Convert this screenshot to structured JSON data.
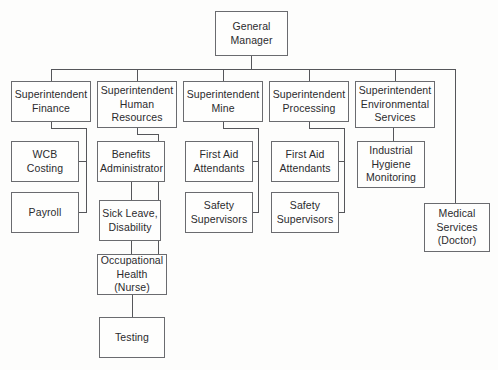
{
  "chart_data": {
    "type": "diagram",
    "diagram_type": "organizational-chart",
    "title": "",
    "orientation": "top-down",
    "line_color": "#55565a",
    "box_border_color": "#6a6b6f",
    "background_color": "#fdfdfc",
    "text_color": "#2b2b2d",
    "nodes": [
      {
        "id": "gm",
        "label": "General\nManager",
        "level": 0,
        "x": 215,
        "y": 11,
        "w": 73,
        "h": 45
      },
      {
        "id": "sup_finance",
        "label": "Superintendent\nFinance",
        "level": 1,
        "parent": "gm",
        "x": 11,
        "y": 81,
        "w": 80,
        "h": 41
      },
      {
        "id": "sup_hr",
        "label": "Superintendent\nHuman\nResources",
        "level": 1,
        "parent": "gm",
        "x": 97,
        "y": 81,
        "w": 80,
        "h": 47
      },
      {
        "id": "sup_mine",
        "label": "Superintendent\nMine",
        "level": 1,
        "parent": "gm",
        "x": 183,
        "y": 81,
        "w": 80,
        "h": 41
      },
      {
        "id": "sup_processing",
        "label": "Superintendent\nProcessing",
        "level": 1,
        "parent": "gm",
        "x": 269,
        "y": 81,
        "w": 80,
        "h": 41
      },
      {
        "id": "sup_env",
        "label": "Superintendent\nEnvironmental\nServices",
        "level": 1,
        "parent": "gm",
        "x": 355,
        "y": 81,
        "w": 80,
        "h": 47
      },
      {
        "id": "wcb",
        "label": "WCB\nCosting",
        "level": 2,
        "parent": "sup_finance",
        "x": 11,
        "y": 141,
        "w": 68,
        "h": 41
      },
      {
        "id": "payroll",
        "label": "Payroll",
        "level": 2,
        "parent": "sup_finance",
        "x": 11,
        "y": 192,
        "w": 68,
        "h": 41
      },
      {
        "id": "benefits",
        "label": "Benefits\nAdministrator",
        "level": 2,
        "parent": "sup_hr",
        "x": 97,
        "y": 141,
        "w": 68,
        "h": 41
      },
      {
        "id": "sick_leave",
        "label": "Sick Leave,\nDisability",
        "level": 3,
        "parent": "benefits",
        "x": 99,
        "y": 200,
        "w": 62,
        "h": 41
      },
      {
        "id": "occ_health",
        "label": "Occupational\nHealth (Nurse)",
        "level": 4,
        "parent": "sick_leave",
        "x": 97,
        "y": 254,
        "w": 70,
        "h": 41
      },
      {
        "id": "testing",
        "label": "Testing",
        "level": 5,
        "parent": "occ_health",
        "x": 99,
        "y": 317,
        "w": 66,
        "h": 41
      },
      {
        "id": "mine_first_aid",
        "label": "First Aid\nAttendants",
        "level": 2,
        "parent": "sup_mine",
        "x": 185,
        "y": 141,
        "w": 68,
        "h": 41
      },
      {
        "id": "mine_safety",
        "label": "Safety\nSupervisors",
        "level": 2,
        "parent": "sup_mine",
        "x": 185,
        "y": 192,
        "w": 68,
        "h": 41
      },
      {
        "id": "proc_first_aid",
        "label": "First Aid\nAttendants",
        "level": 2,
        "parent": "sup_processing",
        "x": 271,
        "y": 141,
        "w": 68,
        "h": 41
      },
      {
        "id": "proc_safety",
        "label": "Safety\nSupervisors",
        "level": 2,
        "parent": "sup_processing",
        "x": 271,
        "y": 192,
        "w": 68,
        "h": 41
      },
      {
        "id": "ind_hygiene",
        "label": "Industrial\nHygiene\nMonitoring",
        "level": 2,
        "parent": "sup_env",
        "x": 357,
        "y": 141,
        "w": 68,
        "h": 47
      },
      {
        "id": "medical",
        "label": "Medical\nServices\n(Doctor)",
        "level": 2,
        "parent": "gm",
        "x": 424,
        "y": 203,
        "w": 66,
        "h": 49
      }
    ],
    "edges": [
      {
        "from": "gm",
        "to": "sup_finance",
        "style": "bus"
      },
      {
        "from": "gm",
        "to": "sup_hr",
        "style": "bus"
      },
      {
        "from": "gm",
        "to": "sup_mine",
        "style": "bus"
      },
      {
        "from": "gm",
        "to": "sup_processing",
        "style": "bus"
      },
      {
        "from": "gm",
        "to": "sup_env",
        "style": "bus"
      },
      {
        "from": "gm",
        "to": "medical",
        "style": "bus-right-drop"
      },
      {
        "from": "sup_finance",
        "to": "wcb",
        "style": "side-spine"
      },
      {
        "from": "sup_finance",
        "to": "payroll",
        "style": "side-spine"
      },
      {
        "from": "sup_hr",
        "to": "benefits",
        "style": "side-spine"
      },
      {
        "from": "sup_hr",
        "to": "occ_health",
        "style": "side-spine"
      },
      {
        "from": "benefits",
        "to": "sick_leave",
        "style": "direct"
      },
      {
        "from": "sick_leave",
        "to": "occ_health",
        "style": "direct"
      },
      {
        "from": "occ_health",
        "to": "testing",
        "style": "direct"
      },
      {
        "from": "sup_mine",
        "to": "mine_first_aid",
        "style": "side-spine"
      },
      {
        "from": "sup_mine",
        "to": "mine_safety",
        "style": "side-spine"
      },
      {
        "from": "sup_processing",
        "to": "proc_first_aid",
        "style": "side-spine"
      },
      {
        "from": "sup_processing",
        "to": "proc_safety",
        "style": "side-spine"
      },
      {
        "from": "sup_env",
        "to": "ind_hygiene",
        "style": "direct"
      }
    ],
    "connector_geometry": {
      "top_bus_y": 69,
      "top_bus_x_start": 51,
      "top_bus_x_end": 455,
      "gm_drop_x": 251,
      "medical_drop_x": 455,
      "finance_spine_x": 86,
      "hr_spine_x": 158,
      "mine_spine_x": 258,
      "processing_spine_x": 344
    }
  }
}
